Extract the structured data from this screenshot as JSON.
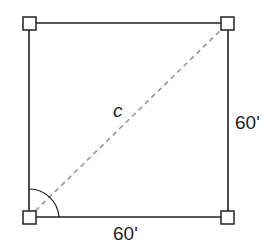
{
  "diagram": {
    "type": "square-with-diagonal",
    "labels": {
      "diagonal": "c",
      "right_side": "60'",
      "bottom_side": "60'"
    },
    "colors": {
      "stroke": "#222222",
      "diagonal": "#999999",
      "background": "#ffffff"
    },
    "corners": [
      "top-left",
      "top-right",
      "bottom-right",
      "bottom-left"
    ]
  }
}
